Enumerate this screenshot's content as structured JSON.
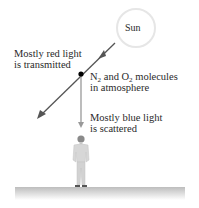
{
  "diagram": {
    "sun": {
      "label": "Sun"
    },
    "transmitted": {
      "line1": "Mostly red light",
      "line2": "is transmitted"
    },
    "molecules": {
      "n": "N",
      "n_sub": "2",
      "mid": " and O",
      "o_sub": "2",
      "rest": " molecules",
      "line2": "in atmosphere"
    },
    "scattered": {
      "line1": "Mostly blue light",
      "line2": "is scattered"
    },
    "colors": {
      "line": "#555555",
      "scatter_line": "#888888",
      "dot": "#000000",
      "sun_stroke": "#e4e4e4",
      "ground": "#cfcfcf"
    }
  }
}
